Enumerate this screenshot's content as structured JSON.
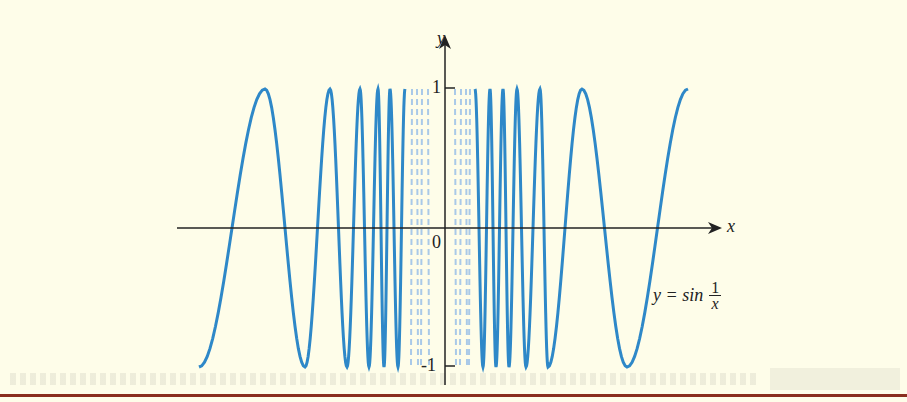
{
  "chart_data": {
    "type": "line",
    "title": "",
    "function": "y = sin(1/x)",
    "xlabel": "x",
    "ylabel": "y",
    "ylim": [
      -1,
      1
    ],
    "y_ticks": [
      {
        "value": 1,
        "label": "1"
      },
      {
        "value": -1,
        "label": "-1"
      }
    ],
    "origin_label": "0",
    "annotation": {
      "lhs": "y = sin",
      "numerator": "1",
      "denominator": "x"
    },
    "series": [
      {
        "name": "sin(1/x) solid",
        "style": "solid",
        "color": "#2e88c8"
      },
      {
        "name": "sin(1/x) near 0",
        "style": "dashed",
        "color": "#a9c9e8"
      }
    ],
    "extrema_left": [
      {
        "y": -1,
        "note": "start"
      },
      {
        "y": 1
      },
      {
        "y": -1
      },
      {
        "y": 1
      },
      {
        "y": -1
      },
      {
        "y": 1
      },
      {
        "y": -1
      },
      {
        "y": 1
      },
      {
        "y": -1
      },
      {
        "y": 1
      },
      {
        "y": -1
      },
      {
        "y": 1
      }
    ],
    "extrema_right": [
      {
        "y": -1
      },
      {
        "y": 1
      },
      {
        "y": -1
      },
      {
        "y": 1
      },
      {
        "y": -1
      },
      {
        "y": 1
      },
      {
        "y": -1
      },
      {
        "y": 1
      },
      {
        "y": -1
      },
      {
        "y": 1
      },
      {
        "y": -1
      },
      {
        "y": 1,
        "note": "end"
      }
    ],
    "grid": false,
    "legend": "none"
  },
  "colors": {
    "background": "#fefde9",
    "curve": "#2e88c8",
    "curve_dashed": "#a9c9e8",
    "axes": "#222222",
    "rule": "#8a2e1e"
  }
}
